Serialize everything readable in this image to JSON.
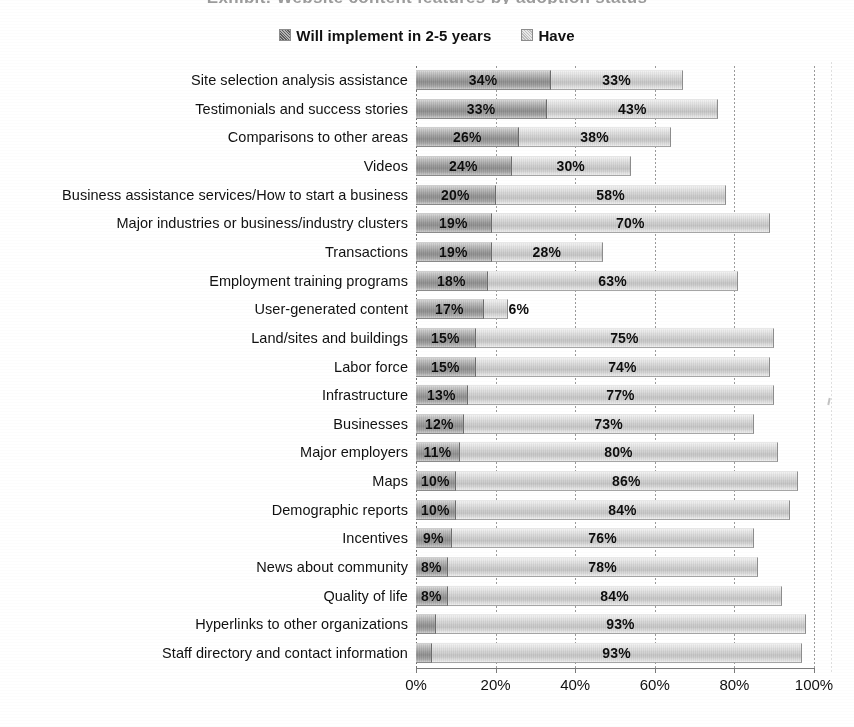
{
  "title_strip": "Exhibit: Website content features by adoption status",
  "legend": {
    "position": "top-center",
    "items": [
      {
        "label": "Will implement in 2-5 years",
        "swatch": "legend-swatch-dark",
        "color": "#9d9d9d"
      },
      {
        "label": "Have",
        "swatch": "legend-swatch-light",
        "color": "#cfcfcf"
      }
    ]
  },
  "axis": {
    "ticks": [
      "0%",
      "20%",
      "40%",
      "60%",
      "80%",
      "100%"
    ],
    "tick_values": [
      0,
      20,
      40,
      60,
      80,
      100
    ]
  },
  "chart_data": {
    "type": "bar",
    "orientation": "horizontal",
    "stacked": true,
    "title": "",
    "xlabel": "",
    "ylabel": "",
    "xlim": [
      0,
      100
    ],
    "xticks": [
      0,
      20,
      40,
      60,
      80,
      100
    ],
    "xticklabels": [
      "0%",
      "20%",
      "40%",
      "60%",
      "80%",
      "100%"
    ],
    "grid": true,
    "legend_position": "top-center",
    "categories": [
      "Site selection analysis assistance",
      "Testimonials and success stories",
      "Comparisons to other areas",
      "Videos",
      "Business assistance services/How to start a business",
      "Major industries or business/industry clusters",
      "Transactions",
      "Employment training programs",
      "User-generated content",
      "Land/sites and buildings",
      "Labor force",
      "Infrastructure",
      "Businesses",
      "Major employers",
      "Maps",
      "Demographic reports",
      "Incentives",
      "News about community",
      "Quality of life",
      "Hyperlinks to other organizations",
      "Staff directory and contact information"
    ],
    "series": [
      {
        "name": "Will implement in 2-5 years",
        "color": "#9d9d9d",
        "values": [
          34,
          33,
          26,
          24,
          20,
          19,
          19,
          18,
          17,
          15,
          15,
          13,
          12,
          11,
          10,
          10,
          9,
          8,
          8,
          5,
          4
        ],
        "labels": [
          "34%",
          "33%",
          "26%",
          "24%",
          "20%",
          "19%",
          "19%",
          "18%",
          "17%",
          "15%",
          "15%",
          "13%",
          "12%",
          "11%",
          "10%",
          "10%",
          "9%",
          "8%",
          "8%",
          "5%",
          "4%"
        ]
      },
      {
        "name": "Have",
        "color": "#cfcfcf",
        "values": [
          33,
          43,
          38,
          30,
          58,
          70,
          28,
          63,
          6,
          75,
          74,
          77,
          73,
          80,
          86,
          84,
          76,
          78,
          84,
          93,
          93
        ],
        "labels": [
          "33%",
          "43%",
          "38%",
          "30%",
          "58%",
          "70%",
          "28%",
          "63%",
          "6%",
          "75%",
          "74%",
          "77%",
          "73%",
          "80%",
          "86%",
          "84%",
          "76%",
          "78%",
          "84%",
          "93%",
          "93%"
        ]
      }
    ]
  }
}
